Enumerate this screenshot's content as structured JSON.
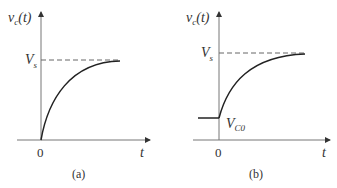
{
  "figures": [
    {
      "id": "a",
      "caption": "(a)",
      "y_label": "v",
      "y_label_sub": "c",
      "y_label_arg": "(t)",
      "x_label": "t",
      "origin_label": "0",
      "level_label": "V",
      "level_label_sub": "s"
    },
    {
      "id": "b",
      "caption": "(b)",
      "y_label": "v",
      "y_label_sub": "c",
      "y_label_arg": "(t)",
      "x_label": "t",
      "origin_label": "0",
      "level_label": "V",
      "level_label_sub": "s",
      "initial_label": "V",
      "initial_label_sub": "C0"
    }
  ],
  "colors": {
    "axis": "#666666",
    "curve": "#222222",
    "dash": "#555555"
  }
}
